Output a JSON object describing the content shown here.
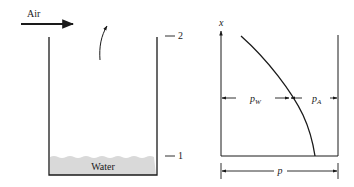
{
  "tank": {
    "air_label": "Air",
    "water_label": "Water",
    "level_top": "2",
    "level_bottom": "1",
    "water_color": "#d9d9d9"
  },
  "plot": {
    "axis_label": "x",
    "pw_label": "p",
    "pw_sub": "W",
    "pa_label": "p",
    "pa_sub": "A",
    "total_label": "p"
  },
  "colors": {
    "line": "#1a1a1a",
    "water": "#d9d9d9"
  }
}
